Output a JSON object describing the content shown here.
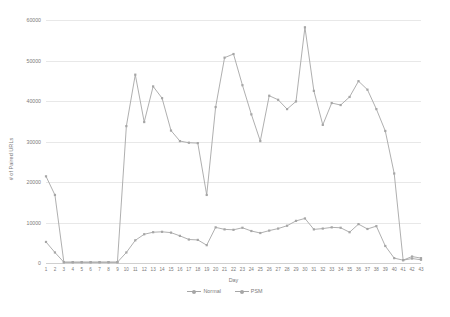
{
  "chart_data": {
    "type": "line",
    "title": "",
    "xlabel": "Day",
    "ylabel": "# of Paired URLs",
    "xlim": [
      1,
      43
    ],
    "ylim": [
      0,
      60000
    ],
    "yticks": [
      0,
      10000,
      20000,
      30000,
      40000,
      50000,
      60000
    ],
    "grid": true,
    "legend_position": "bottom",
    "categories": [
      1,
      2,
      3,
      4,
      5,
      6,
      7,
      8,
      9,
      10,
      11,
      12,
      13,
      14,
      15,
      16,
      17,
      18,
      19,
      20,
      21,
      22,
      23,
      24,
      25,
      26,
      27,
      28,
      29,
      30,
      31,
      32,
      33,
      34,
      35,
      36,
      37,
      38,
      39,
      40,
      41,
      42,
      43
    ],
    "series": [
      {
        "name": "Normal",
        "color": "#a6a6a6",
        "values": [
          5200,
          2600,
          200,
          200,
          200,
          200,
          200,
          200,
          200,
          2600,
          5600,
          7100,
          7600,
          7700,
          7500,
          6700,
          5800,
          5700,
          4400,
          8800,
          8300,
          8200,
          8700,
          7900,
          7400,
          8000,
          8500,
          9200,
          10400,
          11000,
          8300,
          8500,
          8800,
          8700,
          7600,
          9600,
          8400,
          9100,
          4200,
          1200,
          700,
          1600,
          1200
        ]
      },
      {
        "name": "PSM",
        "color": "#a6a6a6",
        "values": [
          21400,
          16800,
          200,
          200,
          200,
          200,
          200,
          200,
          200,
          33800,
          46500,
          34800,
          43600,
          40700,
          32700,
          30100,
          29700,
          29600,
          16800,
          38500,
          50700,
          51600,
          43900,
          36700,
          30100,
          41300,
          40300,
          38000,
          39900,
          58200,
          42500,
          34100,
          39500,
          39000,
          41000,
          44900,
          42800,
          38000,
          32600,
          22100,
          700,
          1100,
          800
        ]
      }
    ]
  },
  "legend": {
    "items": [
      {
        "label": "Normal"
      },
      {
        "label": "PSM"
      }
    ]
  }
}
